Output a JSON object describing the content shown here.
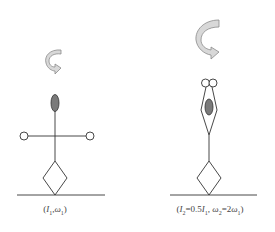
{
  "figures": [
    {
      "id": "before",
      "label": {
        "open": "(",
        "I": "I",
        "I_sub": "1",
        "sep": ",",
        "w": "ω",
        "w_sub": "1",
        "close": ")"
      },
      "arms": "extended",
      "rotation_arrow": "small"
    },
    {
      "id": "after",
      "label": {
        "open": "(",
        "I": "I",
        "I_sub": "2",
        "eq1": "=0.5",
        "I2": "I",
        "I2_sub": "1",
        "sep": ",",
        "w": "ω",
        "w_sub": "2",
        "eq2": "=2",
        "w2": "ω",
        "w2_sub": "1",
        "close": ")"
      },
      "arms": "raised",
      "rotation_arrow": "large"
    }
  ],
  "colors": {
    "line": "#333333",
    "head_fill": "#7a7a7a",
    "arrow_fill": "#d8d8d8",
    "arrow_stroke": "#8a8a8a"
  }
}
